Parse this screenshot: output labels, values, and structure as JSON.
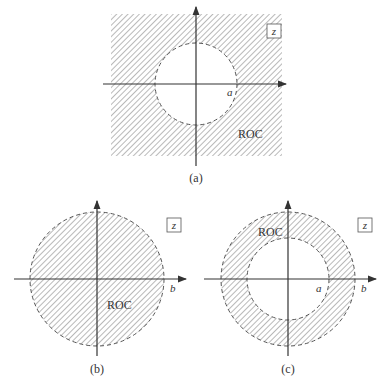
{
  "panels": [
    {
      "id": "a",
      "caption": "(a)",
      "roc_label": "ROC",
      "plane_label": "z",
      "radius_labels": [
        "a"
      ],
      "description": "ROC exterior of circle |z| > a"
    },
    {
      "id": "b",
      "caption": "(b)",
      "roc_label": "ROC",
      "plane_label": "z",
      "radius_labels": [
        "b"
      ],
      "description": "ROC interior of circle |z| < b"
    },
    {
      "id": "c",
      "caption": "(c)",
      "roc_label": "ROC",
      "plane_label": "z",
      "radius_labels": [
        "a",
        "b"
      ],
      "description": "ROC annulus a < |z| < b"
    }
  ],
  "colors": {
    "hatch": "#8a8a8a",
    "axis": "#333333",
    "circle": "#555555"
  }
}
